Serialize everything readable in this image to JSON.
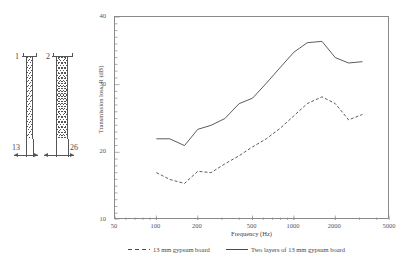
{
  "figure": {
    "diagram": {
      "name": "wall-section-diagram",
      "label_1": "1",
      "label_2": "2",
      "dim_1": "13",
      "dim_2": "26"
    },
    "axis": {
      "ylabel": "Transmission loss, R (dB)",
      "xlabel": "Frequency (Hz)"
    }
  },
  "chart_data": {
    "type": "line",
    "title": "",
    "xlabel": "Frequency (Hz)",
    "ylabel": "Transmission loss, R (dB)",
    "xscale": "log",
    "xlim": [
      50,
      5000
    ],
    "ylim": [
      10,
      40
    ],
    "xticks": [
      50,
      100,
      200,
      500,
      1000,
      2000,
      5000
    ],
    "xtick_labels": [
      "50",
      "100",
      "200",
      "500",
      "1000",
      "2000",
      "5000"
    ],
    "yticks": [
      10,
      20,
      30,
      40
    ],
    "ytick_labels": [
      "10",
      "20",
      "30",
      "40"
    ],
    "grid": false,
    "legend_position": "below",
    "x": [
      100,
      125,
      160,
      200,
      250,
      315,
      400,
      500,
      630,
      800,
      1000,
      1250,
      1600,
      2000,
      2500,
      3150
    ],
    "series": [
      {
        "name": "13 mm gypsum board",
        "style": "dashed",
        "color": "#4a4a4a",
        "values": [
          17.0,
          16.0,
          15.4,
          17.2,
          17.0,
          18.3,
          19.5,
          20.8,
          22.0,
          23.6,
          25.4,
          27.2,
          28.2,
          27.2,
          24.8,
          25.6
        ]
      },
      {
        "name": "Two layers of 13 mm gypsum board",
        "style": "solid",
        "color": "#4a4a4a",
        "values": [
          22.0,
          22.0,
          21.0,
          23.4,
          24.0,
          25.0,
          27.2,
          28.0,
          30.2,
          32.6,
          34.8,
          36.2,
          36.4,
          34.0,
          33.2,
          33.4
        ]
      }
    ]
  },
  "legend": {
    "items": [
      {
        "label": "13 mm gypsum board",
        "style": "dashed"
      },
      {
        "label": "Two layers of 13 mm gypsum board",
        "style": "solid"
      }
    ]
  }
}
